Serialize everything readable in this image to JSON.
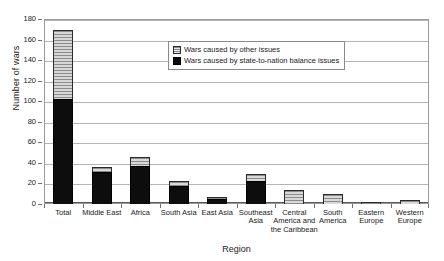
{
  "chart_data": {
    "type": "bar",
    "subtype": "stacked-vertical",
    "title": "",
    "xlabel": "Region",
    "ylabel": "Number of wars",
    "ylim": [
      0,
      180
    ],
    "ytick_values": [
      0,
      20,
      40,
      60,
      80,
      100,
      120,
      140,
      160,
      180
    ],
    "ytick_labels": [
      "0",
      "20",
      "40",
      "60",
      "80",
      "100",
      "120",
      "140",
      "160",
      "180"
    ],
    "grid": "horizontal",
    "legend_position": "inside-top-center",
    "categories": [
      "Total",
      "Middle East",
      "Africa",
      "South Asia",
      "East Asia",
      "Southeast Asia",
      "Central America and the Caribbean",
      "South America",
      "Eastern Europe",
      "Western Europe"
    ],
    "category_labels_wrapped": [
      [
        "Total"
      ],
      [
        "Middle East"
      ],
      [
        "Africa"
      ],
      [
        "South Asia"
      ],
      [
        "East Asia"
      ],
      [
        "Southeast",
        "Asia"
      ],
      [
        "Central",
        "America and",
        "the Caribbean"
      ],
      [
        "South",
        "America"
      ],
      [
        "Eastern",
        "Europe"
      ],
      [
        "Western",
        "Europe"
      ]
    ],
    "series": [
      {
        "name": "Wars caused by state-to-nation balance issues",
        "color": "#0d0d0d",
        "values": [
          102,
          31,
          37,
          18,
          5,
          22,
          0,
          0,
          0,
          0
        ]
      },
      {
        "name": "Wars caused by other issues",
        "color": "#c9c9c9",
        "values": [
          67,
          5,
          9,
          4,
          2,
          7,
          14,
          10,
          2,
          4
        ]
      }
    ],
    "totals": [
      169,
      36,
      46,
      22,
      7,
      29,
      14,
      10,
      2,
      4
    ]
  },
  "legend": {
    "entries": [
      {
        "label": "Wars caused by other issues",
        "swatch": "other"
      },
      {
        "label": "Wars caused by state-to-nation balance issues",
        "swatch": "state"
      }
    ]
  }
}
